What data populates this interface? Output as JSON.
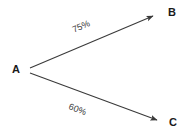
{
  "diagram": {
    "type": "directed-graph",
    "title": "",
    "background_color": "#ffffff",
    "line_color": "#3a3a3a",
    "label_color": "#1a1a1a",
    "nodes": [
      {
        "id": "A",
        "label": "A",
        "x": 28,
        "y": 70
      },
      {
        "id": "B",
        "label": "B",
        "x": 158,
        "y": 14
      },
      {
        "id": "C",
        "label": "C",
        "x": 162,
        "y": 122
      }
    ],
    "edges": [
      {
        "id": "ab",
        "from": "A",
        "to": "B",
        "label": "75%",
        "arrowhead": "filled-triangle",
        "x1": 30,
        "y1": 68,
        "x2": 157,
        "y2": 14,
        "label_angle_deg": -23.3
      },
      {
        "id": "ac",
        "from": "A",
        "to": "C",
        "label": "60%",
        "arrowhead": "filled-triangle",
        "x1": 30,
        "y1": 73,
        "x2": 161,
        "y2": 122,
        "label_angle_deg": 21.3
      }
    ]
  }
}
